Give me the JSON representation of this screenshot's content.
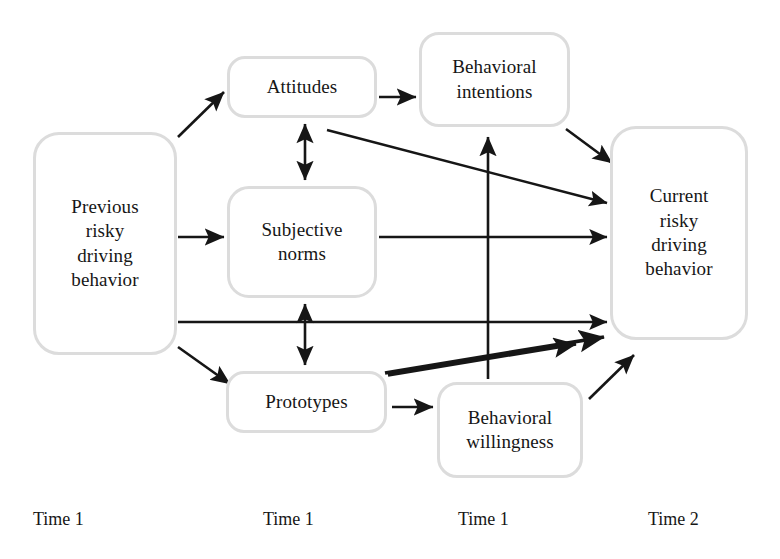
{
  "diagram": {
    "type": "path-model-diagram",
    "style": {
      "box_border_color": "#dcdcdc",
      "arrow_color": "#161616",
      "background_color": "#ffffff",
      "text_color": "#161616"
    },
    "nodes": [
      {
        "id": "previous",
        "label": "Previous\nrisky\ndriving\nbehavior",
        "column": 0
      },
      {
        "id": "attitudes",
        "label": "Attitudes",
        "column": 1
      },
      {
        "id": "subjective",
        "label": "Subjective\nnorms",
        "column": 1
      },
      {
        "id": "prototypes",
        "label": "Prototypes",
        "column": 1
      },
      {
        "id": "intentions",
        "label": "Behavioral\nintentions",
        "column": 2
      },
      {
        "id": "willingness",
        "label": "Behavioral\nwillingness",
        "column": 2
      },
      {
        "id": "current",
        "label": "Current\nrisky\ndriving\nbehavior",
        "column": 3
      }
    ],
    "edges": [
      {
        "id": "previous-to-attitudes",
        "from": "previous",
        "to": "attitudes",
        "arrow": "single"
      },
      {
        "id": "previous-to-subjective",
        "from": "previous",
        "to": "subjective",
        "arrow": "single"
      },
      {
        "id": "previous-to-prototypes",
        "from": "previous",
        "to": "prototypes",
        "arrow": "single"
      },
      {
        "id": "previous-to-current",
        "from": "previous",
        "to": "current",
        "arrow": "single"
      },
      {
        "id": "attitudes-to-intentions",
        "from": "attitudes",
        "to": "intentions",
        "arrow": "single"
      },
      {
        "id": "attitudes-to-current",
        "from": "attitudes",
        "to": "current",
        "arrow": "single"
      },
      {
        "id": "attitudes-subjective-assoc",
        "from": "attitudes",
        "to": "subjective",
        "arrow": "double"
      },
      {
        "id": "subjective-to-current",
        "from": "subjective",
        "to": "current",
        "arrow": "single"
      },
      {
        "id": "subjective-prototypes-assoc",
        "from": "subjective",
        "to": "prototypes",
        "arrow": "double"
      },
      {
        "id": "prototypes-to-willingness",
        "from": "prototypes",
        "to": "willingness",
        "arrow": "single"
      },
      {
        "id": "prototypes-to-current",
        "from": "prototypes",
        "to": "current",
        "arrow": "single"
      },
      {
        "id": "intentions-to-current",
        "from": "intentions",
        "to": "current",
        "arrow": "single"
      },
      {
        "id": "willingness-to-intentions",
        "from": "willingness",
        "to": "intentions",
        "arrow": "single"
      },
      {
        "id": "willingness-to-current",
        "from": "willingness",
        "to": "current",
        "arrow": "single"
      }
    ],
    "time_labels": [
      {
        "id": "time-0",
        "label": "Time 1"
      },
      {
        "id": "time-1",
        "label": "Time 1"
      },
      {
        "id": "time-2",
        "label": "Time 1"
      },
      {
        "id": "time-3",
        "label": "Time 2"
      }
    ]
  }
}
